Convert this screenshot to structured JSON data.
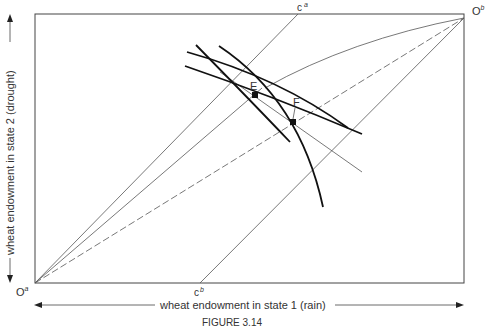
{
  "figure": {
    "caption": "FIGURE 3.14",
    "x_axis_label": "wheat endowment  in state 1 (rain)",
    "y_axis_label": "wheat endowment  in state 2 (drought)",
    "origin_a": "O",
    "origin_a_sup": "a",
    "origin_b": "O",
    "origin_b_sup": "b",
    "certainty_a": "c",
    "certainty_a_sup": "a",
    "certainty_b": "c",
    "certainty_b_sup": "b",
    "point_e": "E",
    "point_f": "F"
  },
  "colors": {
    "thick_curve": "#111111",
    "thin_line": "#555555",
    "box": "#444444"
  }
}
